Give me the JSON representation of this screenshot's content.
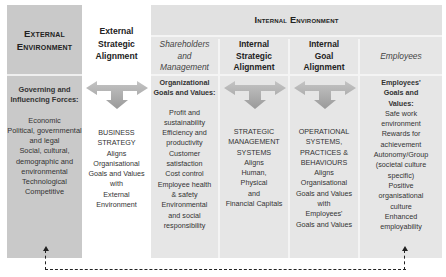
{
  "external_environment": {
    "title": "External Environment",
    "subtitle": "Governing and Influencing Forces:",
    "items": [
      "Economic",
      "Political, governmental and legal",
      "Social, cultural, demographic and environmental",
      "Technological",
      "Competitive"
    ]
  },
  "external_strategic_alignment": {
    "title": "External Strategic Alignment",
    "body_lines": [
      "BUSINESS",
      "STRATEGY",
      "Aligns",
      "Organisational",
      "Goals and Values",
      "with",
      "External",
      "Environment"
    ]
  },
  "internal_environment": {
    "title": "Internal Environment",
    "columns": [
      {
        "header": "Shareholders and Management",
        "subtitle": "Organizational Goals and Values:",
        "lines": [
          "Profit and",
          "sustainability",
          "Efficiency and",
          "productivity",
          "Customer",
          "satisfaction",
          "Cost control",
          "Employee health",
          "& safety",
          "Environmental",
          "and social",
          "responsibility"
        ]
      },
      {
        "header": "Internal Strategic Alignment",
        "lines": [
          "STRATEGIC",
          "MANAGEMENT",
          "SYSTEMS",
          "Aligns",
          "Human,",
          "Physical",
          "and",
          "Financial Capitals"
        ]
      },
      {
        "header": "Internal Goal Alignment",
        "lines": [
          "OPERATIONAL",
          "SYSTEMS,",
          "PRACTICES &",
          "BEHAVIOURS",
          "Aligns",
          "Organisational",
          "Goals and Values",
          "with",
          "Employees'",
          "Goals and Values"
        ]
      },
      {
        "header": "Employees",
        "subtitle": "Employees' Goals and Values:",
        "lines": [
          "Safe work",
          "environment",
          "Rewards for",
          "achievement",
          "Autonomy/Group",
          "(societal culture",
          "specific)",
          "Positive",
          "organisational",
          "culture",
          "Enhanced",
          "employability"
        ]
      }
    ]
  },
  "colors": {
    "external_block": "#c9c9c9",
    "internal_block": "#e6e6e6",
    "arrow": "#a8a8a8",
    "dashed_line": "#222222"
  },
  "feedback_loop": {
    "from": "Employees",
    "to": "External Environment",
    "style": "dashed"
  }
}
